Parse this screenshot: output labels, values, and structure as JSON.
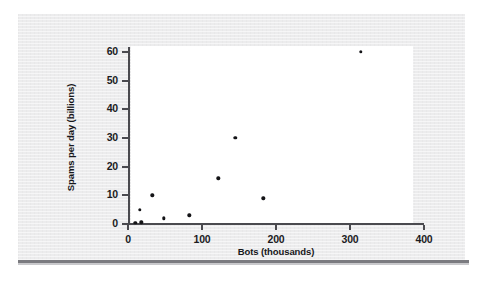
{
  "chart_data": {
    "type": "scatter",
    "title": "",
    "xlabel": "Bots (thousands)",
    "ylabel": "Spams per day (billions)",
    "xlim": [
      0,
      400
    ],
    "ylim": [
      0,
      62
    ],
    "xticks": [
      0,
      100,
      200,
      300,
      400
    ],
    "yticks": [
      0,
      10,
      20,
      30,
      40,
      50,
      60
    ],
    "xtick_labels": [
      "0",
      "100",
      "200",
      "300",
      "400"
    ],
    "ytick_labels": [
      "0",
      "10",
      "20",
      "30",
      "40",
      "50",
      "60"
    ],
    "grid": false,
    "legend": null,
    "series": [
      {
        "name": "Botnets",
        "points": [
          {
            "x": 10,
            "y": 0.5
          },
          {
            "x": 18,
            "y": 0.6
          },
          {
            "x": 16,
            "y": 5
          },
          {
            "x": 33,
            "y": 10
          },
          {
            "x": 48,
            "y": 2
          },
          {
            "x": 83,
            "y": 3
          },
          {
            "x": 122,
            "y": 16
          },
          {
            "x": 145,
            "y": 30
          },
          {
            "x": 183,
            "y": 9
          },
          {
            "x": 315,
            "y": 60
          }
        ]
      }
    ]
  },
  "colors": {
    "figure_background": "#ececed",
    "plot_background": "#ffffff",
    "axis": "#4a4a4f",
    "point": "#141417",
    "shadow_rule": "#7b7b80"
  }
}
